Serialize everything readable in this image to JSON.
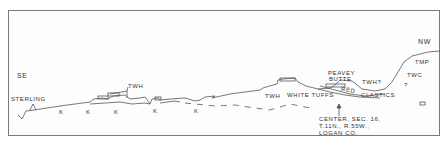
{
  "diagram": {
    "type": "geologic-cross-section",
    "directions": {
      "left": "SE",
      "right": "NW"
    },
    "places": {
      "town": "STERLING"
    },
    "units": {
      "k": "K",
      "twh": "TWH",
      "twh_q": "TWH?",
      "tmp": "TMP",
      "twc": "TWC",
      "q": "?"
    },
    "labels": {
      "white_tuffs": "WHITE TUFFS",
      "red": "RED",
      "clastics": "CLASTICS",
      "peavey": "PEAVEY",
      "butte": "BUTTE"
    },
    "location_note": {
      "line1": "CENTER, SEC. 16,",
      "line2": "T.11N., R.55W.,",
      "line3": "LOGAN CO."
    },
    "colors": {
      "line": "#555555",
      "frame": "#7a7a7a",
      "text": "#333333",
      "background": "#fdfdfd"
    }
  }
}
